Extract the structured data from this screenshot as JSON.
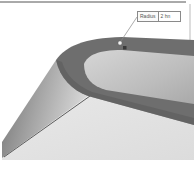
{
  "viewport": {
    "type": "3d-cad-model-view",
    "colors": {
      "background": "#ffffff",
      "fillet_band": "#707070",
      "fillet_band_dark": "#5e5e5e",
      "recess_floor": "#c8c8c8",
      "top_face": "#e4e4e4",
      "side_face": "#9a9a9a",
      "edge": "#3a3a3a",
      "border": "#555555"
    }
  },
  "dimension": {
    "label": "Radius",
    "value": "2 hn"
  }
}
